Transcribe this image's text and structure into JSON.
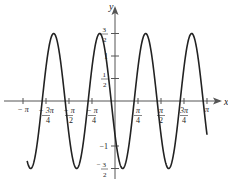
{
  "chart_data": {
    "type": "line",
    "title": "",
    "xlabel": "x",
    "ylabel": "y",
    "function": "y = (3/2) cos(4x + 2π/3)",
    "xlim": [
      -3.14159,
      3.14159
    ],
    "ylim": [
      -1.5,
      1.5
    ],
    "grid": false,
    "legend": null,
    "series": [
      {
        "name": "curve",
        "amplitude": 1.5,
        "angular_frequency": 4,
        "phase": 2.0944,
        "x_start": -3.0,
        "x_end": 3.14159
      }
    ],
    "x_ticks": [
      {
        "value": -3.14159,
        "label": "− π",
        "num": "",
        "den": ""
      },
      {
        "value": -2.35619,
        "label": "",
        "num": "− 3π",
        "den": "4"
      },
      {
        "value": -1.5708,
        "label": "",
        "num": "− π",
        "den": "2"
      },
      {
        "value": -0.7854,
        "label": "",
        "num": "− π",
        "den": "4"
      },
      {
        "value": 0.7854,
        "label": "",
        "num": "π",
        "den": "4"
      },
      {
        "value": 1.5708,
        "label": "",
        "num": "π",
        "den": "2"
      },
      {
        "value": 2.35619,
        "label": "",
        "num": "3π",
        "den": "4"
      },
      {
        "value": 3.14159,
        "label": "π",
        "num": "",
        "den": ""
      }
    ],
    "y_ticks": [
      {
        "value": 1.5,
        "label": "",
        "num": "3",
        "den": "2"
      },
      {
        "value": 1,
        "label": "1",
        "num": "",
        "den": ""
      },
      {
        "value": 0.5,
        "label": "",
        "num": "1",
        "den": "2"
      },
      {
        "value": -1,
        "label": "−1",
        "num": "",
        "den": ""
      },
      {
        "value": -1.5,
        "label": "",
        "num": "− 3",
        "den": "2"
      }
    ],
    "colors": {
      "curve": "#222222",
      "axis": "#555555",
      "background": "#ffffff"
    }
  },
  "axes": {
    "x_label": "x",
    "y_label": "y"
  }
}
